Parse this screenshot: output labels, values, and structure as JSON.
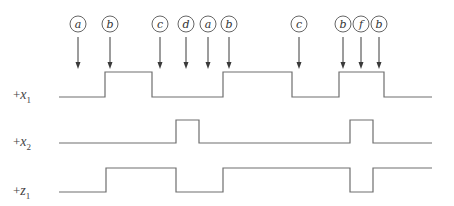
{
  "diagram": {
    "title": "",
    "colors": {
      "wave": "#6e6e6e",
      "arrow": "#3a3a3a",
      "text": "#444444"
    },
    "events": [
      {
        "label": "a",
        "x": 78
      },
      {
        "label": "b",
        "x": 110
      },
      {
        "label": "c",
        "x": 160
      },
      {
        "label": "d",
        "x": 186
      },
      {
        "label": "a",
        "x": 208
      },
      {
        "label": "b",
        "x": 229
      },
      {
        "label": "c",
        "x": 299
      },
      {
        "label": "b",
        "x": 343
      },
      {
        "label": "f",
        "x": 361
      },
      {
        "label": "b",
        "x": 379
      }
    ],
    "signals": [
      {
        "plus": "+",
        "name": "x",
        "sub": "1",
        "label_y": 99,
        "low_y": 97,
        "high_y": 72,
        "start_x": 59,
        "end_x": 432,
        "initial": 0,
        "transitions": [
          105,
          152,
          223,
          292,
          339,
          384
        ]
      },
      {
        "plus": "+",
        "name": "x",
        "sub": "2",
        "label_y": 146,
        "low_y": 143,
        "high_y": 120,
        "start_x": 59,
        "end_x": 432,
        "initial": 0,
        "transitions": [
          176,
          199,
          350,
          373
        ]
      },
      {
        "plus": "+",
        "name": "z",
        "sub": "1",
        "label_y": 195,
        "low_y": 192,
        "high_y": 168,
        "start_x": 59,
        "end_x": 432,
        "initial": 0,
        "transitions": [
          106,
          176,
          223,
          350,
          373
        ]
      }
    ]
  }
}
